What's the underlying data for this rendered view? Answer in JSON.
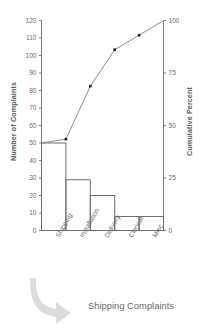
{
  "caption": "Shipping Complaints",
  "colors": {
    "axis": "#808080",
    "bar_outline": "#6e6e6e",
    "line": "#808080",
    "marker": "#222222",
    "text": "#6e6e6e",
    "arrow": "#dcdcdc",
    "background": "#ffffff"
  },
  "chart_data": {
    "type": "bar",
    "title": "",
    "subtitle": "",
    "categories": [
      "Shipping",
      "Installation",
      "Delivery",
      "Clerical",
      "Misc."
    ],
    "values": [
      50,
      29,
      20,
      8,
      8
    ],
    "series": [
      {
        "name": "Number of Complaints",
        "type": "bar",
        "values": [
          50,
          29,
          20,
          8,
          8
        ]
      },
      {
        "name": "Cumulative Percent",
        "type": "line",
        "values": [
          43.5,
          68.7,
          86.1,
          93.0,
          100.0
        ]
      }
    ],
    "cumulative_counts": [
      50,
      79,
      99,
      107,
      115
    ],
    "total": 115,
    "xlabel": "",
    "ylabel": "Number of Complaints",
    "y2label": "Cumulative Percent",
    "ylim": [
      0,
      120
    ],
    "y2lim": [
      0,
      100
    ],
    "yticks": [
      0,
      10,
      20,
      30,
      40,
      50,
      60,
      70,
      80,
      90,
      100,
      110,
      120
    ],
    "y2ticks": [
      0,
      25,
      50,
      75,
      100
    ],
    "ytick_labels": [
      "0",
      "10",
      "20",
      "30",
      "40",
      "50",
      "60",
      "70",
      "80",
      "90",
      "100",
      "110",
      "120"
    ],
    "y2tick_labels": [
      "0",
      "25",
      "50",
      "75",
      "100"
    ],
    "grid": false,
    "legend": "none"
  }
}
